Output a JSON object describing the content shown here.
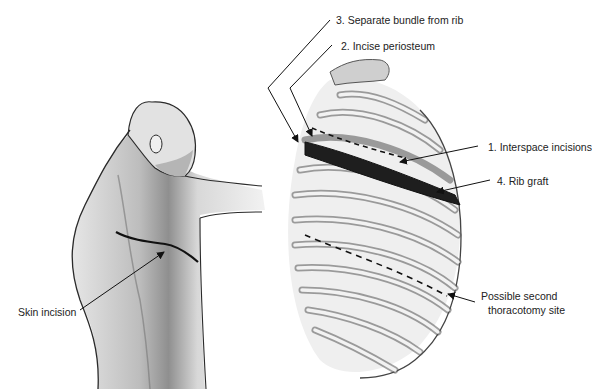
{
  "figure": {
    "labels": {
      "step3": "3. Separate bundle from rib",
      "step2": "2. Incise periosteum",
      "step1": "1. Interspace incisions",
      "step4": "4. Rib graft",
      "second_site_line1": "Possible second",
      "second_site_line2": "thoracotomy site",
      "skin_incision": "Skin incision"
    },
    "colors": {
      "outline": "#2a2a2a",
      "shading": "#9a9a9a",
      "bone": "#cfcfcf",
      "graft": "#1e1e1e",
      "background": "#ffffff"
    }
  }
}
